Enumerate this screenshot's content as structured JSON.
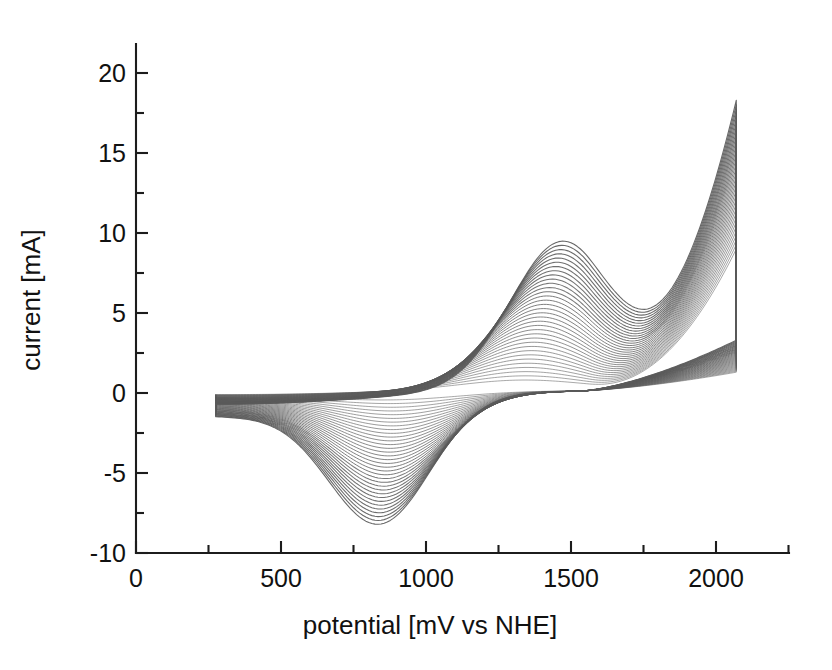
{
  "figure": {
    "background": "#ffffff",
    "line_color": "#5a5a5a",
    "axis_color": "#1c1c1c"
  },
  "chart_data": {
    "type": "line",
    "title": "",
    "subtitle": "",
    "xlabel": "potential [mV vs NHE]",
    "ylabel": "current [mA]",
    "xlim": [
      0,
      2250
    ],
    "ylim": [
      -10,
      22.5
    ],
    "x_ticks": [
      0,
      500,
      1000,
      1500,
      2000
    ],
    "x_ticklabels": [
      "0",
      "500",
      "1000",
      "1500",
      "2000"
    ],
    "x_minor_ticks": [
      250,
      750,
      1250,
      1750,
      2250
    ],
    "y_ticks": [
      -10,
      -5,
      0,
      5,
      10,
      15,
      20
    ],
    "y_ticklabels": [
      "-10",
      "-5",
      "0",
      "5",
      "10",
      "15",
      "20"
    ],
    "y_minor_ticks": [
      -7.5,
      -2.5,
      2.5,
      7.5,
      12.5,
      17.5,
      22.5
    ],
    "grid": false,
    "legend": "none",
    "annotations": [],
    "n_cycles": 34,
    "sweep_start_mV": 275,
    "sweep_end_mV": 2070,
    "series": [
      {
        "name": "anodic peak maximum (final cycle)",
        "x": 1472,
        "y": 9.3
      },
      {
        "name": "cathodic peak minimum (final cycle)",
        "x": 841,
        "y": -7.6
      },
      {
        "name": "upper vertex current (final cycle)",
        "x": 2066,
        "y": 18.3
      },
      {
        "name": "return branch end current",
        "x": 2070,
        "y": 3.3
      },
      {
        "name": "baseline start current",
        "x": 275,
        "y": -1.7
      },
      {
        "name": "crossover potential",
        "x": 1600,
        "y": 1.4
      }
    ],
    "cycle_growth": {
      "anodic_peak_first": 0.6,
      "anodic_peak_last": 9.3,
      "cathodic_peak_first": -0.4,
      "cathodic_peak_last": -7.6,
      "vertex_first": 9.0,
      "vertex_last": 18.3
    }
  }
}
